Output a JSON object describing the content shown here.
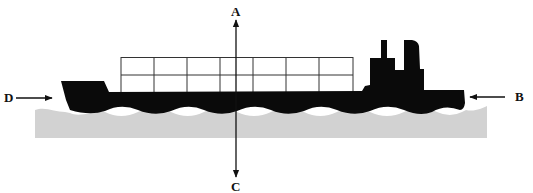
{
  "diagram": {
    "title": "",
    "labels": {
      "top": "A",
      "right": "B",
      "bottom": "C",
      "left": "D"
    },
    "subjects": {
      "ship": "container ship silhouette with stacked containers",
      "water": "wavy sea surface"
    },
    "colors": {
      "ship": "#0a0a0a",
      "water": "#d2d2d2",
      "grid": "#333333",
      "arrows": "#111111",
      "background": "#ffffff"
    },
    "container_grid": {
      "columns": 7,
      "rows": 2
    }
  }
}
